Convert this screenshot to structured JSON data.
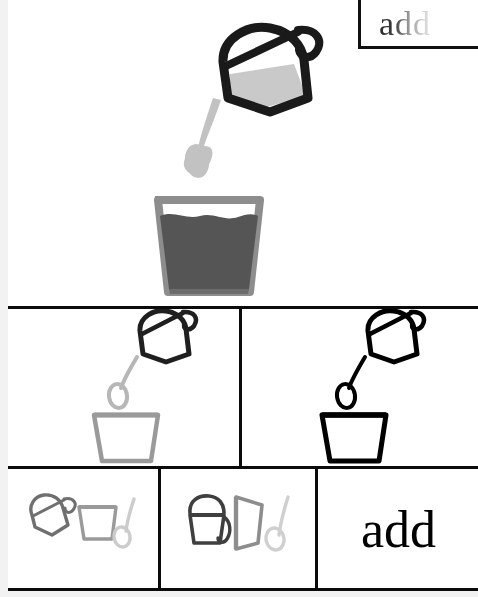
{
  "page": {
    "word": "add",
    "background": "#ffffff",
    "margin_color": "#f2f2f2",
    "rule_color": "#0b0b0b"
  },
  "label_box": {
    "text": "add",
    "gradient_from": "#2b2b2b",
    "gradient_to": "#e2e2e2"
  },
  "panels": [
    {
      "id": "hero-panel",
      "name": "pouring-jug-into-glass-illustration",
      "description": "shaded jug pouring a drop into a full glass",
      "objects": [
        "jug",
        "drop",
        "glass"
      ],
      "style": "shaded"
    },
    {
      "id": "outline-gray-panel",
      "name": "pouring-jug-into-empty-cup-gray-outline",
      "description": "dark jug, gray drop, gray empty cup",
      "objects": [
        "jug",
        "drop",
        "cup"
      ],
      "style": "gray-outline"
    },
    {
      "id": "outline-black-panel",
      "name": "pouring-jug-into-empty-cup-black-outline",
      "description": "black jug, black drop, black empty cup",
      "objects": [
        "jug",
        "drop",
        "cup"
      ],
      "style": "black-outline"
    },
    {
      "id": "separated-shapes-panel",
      "name": "separated-shapes-row",
      "description": "jug, cup and drop drawn apart in light gray",
      "objects": [
        "jug",
        "cup",
        "drop"
      ],
      "style": "light-gray"
    },
    {
      "id": "morph-letters-panel",
      "name": "shapes-morphing-into-letters",
      "description": "jug becomes letter a, cup becomes letter d, drop becomes letter d",
      "letters": [
        "a",
        "d",
        "d"
      ],
      "style": "fading-gray"
    },
    {
      "id": "word-panel",
      "name": "final-word-panel",
      "text": "add",
      "style": "serif-black"
    }
  ],
  "colors": {
    "ink_black": "#111111",
    "dark_gray": "#565656",
    "mid_gray": "#8d8d8d",
    "light_gray": "#bdbdbd",
    "pale_gray": "#d4d4d4",
    "liquid": "#555555",
    "liquid_light": "#c9c9c9"
  }
}
